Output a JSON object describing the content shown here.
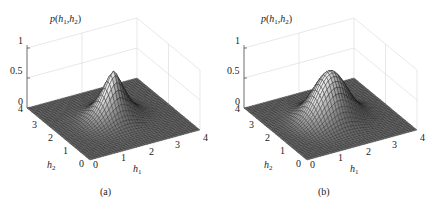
{
  "chart_data": [
    {
      "type": "surface",
      "panel_label": "(a)",
      "zlabel": "p(h1,h2)",
      "xlabel": "h1",
      "ylabel": "h2",
      "x_ticks": [
        "0",
        "1",
        "2",
        "3",
        "4"
      ],
      "y_ticks": [
        "0",
        "1",
        "2",
        "3",
        "4"
      ],
      "z_ticks": [
        "0",
        "0.5",
        "1"
      ],
      "xlim": [
        0,
        4
      ],
      "ylim": [
        0,
        4
      ],
      "zlim": [
        0,
        1
      ],
      "peak": {
        "h1": 2,
        "h2": 2,
        "value": 0.8
      },
      "shape": "sharp",
      "width": 0.45
    },
    {
      "type": "surface",
      "panel_label": "(b)",
      "zlabel": "p(h1,h2)",
      "xlabel": "h1",
      "ylabel": "h2",
      "x_ticks": [
        "0",
        "1",
        "2",
        "3",
        "4"
      ],
      "y_ticks": [
        "0",
        "1",
        "2",
        "3",
        "4"
      ],
      "z_ticks": [
        "0",
        "0.5",
        "1"
      ],
      "xlim": [
        0,
        4
      ],
      "ylim": [
        0,
        4
      ],
      "zlim": [
        0,
        1
      ],
      "peak": {
        "h1": 2,
        "h2": 2,
        "value": 0.8
      },
      "shape": "gaussian",
      "width": 0.55
    }
  ],
  "panels": [
    {
      "caption": "(a)",
      "z_label_p": "p",
      "sub1": "1",
      "sub2": "2",
      "h": "h"
    },
    {
      "caption": "(b)",
      "z_label_p": "p",
      "sub1": "1",
      "sub2": "2",
      "h": "h"
    }
  ]
}
